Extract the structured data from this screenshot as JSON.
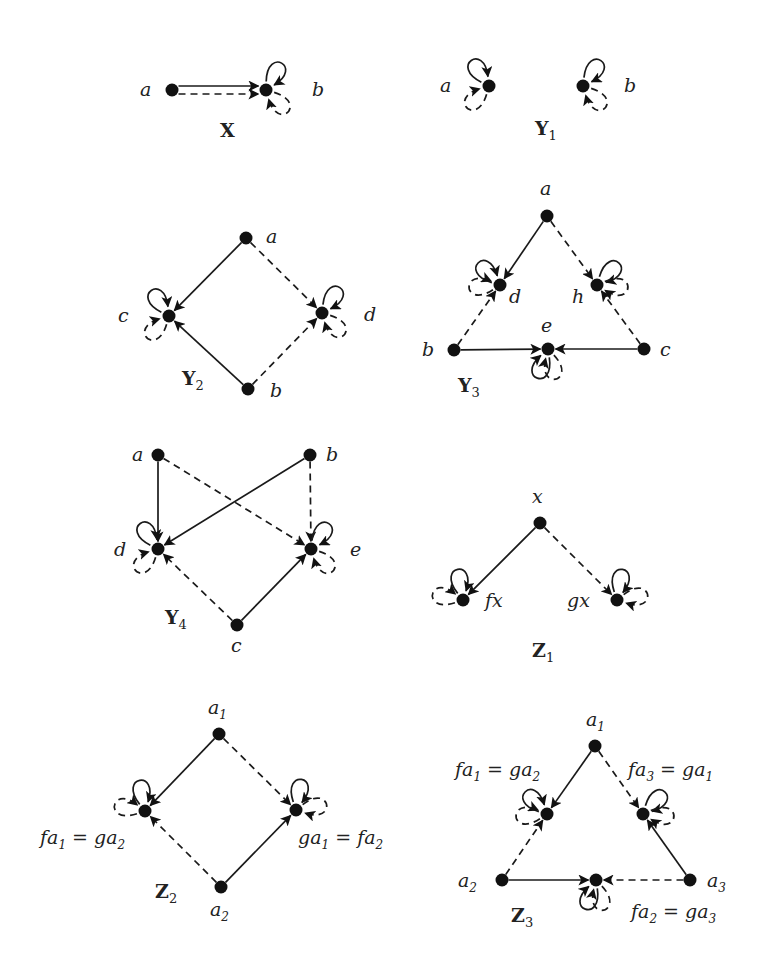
{
  "figure": {
    "colors": {
      "ink": "#1a1a1a",
      "background": "#ffffff"
    },
    "graphs": [
      {
        "id": "X",
        "title": "X",
        "subscript": "",
        "title_pos": [
          220,
          137
        ],
        "nodes": [
          {
            "id": "a",
            "x": 172,
            "y": 90,
            "label": "a",
            "lx": 140,
            "ly": 96
          },
          {
            "id": "b",
            "x": 266,
            "y": 90,
            "label": "b",
            "lx": 312,
            "ly": 96
          }
        ],
        "edges": [
          {
            "from": "a",
            "to": "b",
            "style": "solid",
            "offset": -4
          },
          {
            "from": "a",
            "to": "b",
            "style": "dashed",
            "offset": 4
          }
        ],
        "loops": [
          {
            "node": "b",
            "style": "solid",
            "angle": -60
          },
          {
            "node": "b",
            "style": "dashed",
            "angle": 45
          }
        ]
      },
      {
        "id": "Y1",
        "title": "Y",
        "subscript": "1",
        "title_pos": [
          535,
          135
        ],
        "nodes": [
          {
            "id": "a",
            "x": 489,
            "y": 86,
            "label": "a",
            "lx": 440,
            "ly": 92
          },
          {
            "id": "b",
            "x": 583,
            "y": 86,
            "label": "b",
            "lx": 624,
            "ly": 92
          }
        ],
        "edges": [],
        "loops": [
          {
            "node": "a",
            "style": "solid",
            "angle": -125
          },
          {
            "node": "a",
            "style": "dashed",
            "angle": 135
          },
          {
            "node": "b",
            "style": "solid",
            "angle": -55
          },
          {
            "node": "b",
            "style": "dashed",
            "angle": 45
          }
        ]
      },
      {
        "id": "Y2",
        "title": "Y",
        "subscript": "2",
        "title_pos": [
          182,
          385
        ],
        "nodes": [
          {
            "id": "a",
            "x": 246,
            "y": 238,
            "label": "a",
            "lx": 266,
            "ly": 243
          },
          {
            "id": "c",
            "x": 169,
            "y": 316,
            "label": "c",
            "lx": 118,
            "ly": 322
          },
          {
            "id": "d",
            "x": 322,
            "y": 313,
            "label": "d",
            "lx": 364,
            "ly": 321
          },
          {
            "id": "b",
            "x": 248,
            "y": 389,
            "label": "b",
            "lx": 270,
            "ly": 397
          }
        ],
        "edges": [
          {
            "from": "a",
            "to": "c",
            "style": "solid"
          },
          {
            "from": "a",
            "to": "d",
            "style": "dashed"
          },
          {
            "from": "b",
            "to": "c",
            "style": "solid"
          },
          {
            "from": "b",
            "to": "d",
            "style": "dashed"
          }
        ],
        "loops": [
          {
            "node": "c",
            "style": "solid",
            "angle": -125
          },
          {
            "node": "c",
            "style": "dashed",
            "angle": 135
          },
          {
            "node": "d",
            "style": "solid",
            "angle": -55
          },
          {
            "node": "d",
            "style": "dashed",
            "angle": 45
          }
        ]
      },
      {
        "id": "Y3",
        "title": "Y",
        "subscript": "3",
        "title_pos": [
          458,
          392
        ],
        "nodes": [
          {
            "id": "a",
            "x": 547,
            "y": 216,
            "label": "a",
            "lx": 540,
            "ly": 195
          },
          {
            "id": "d",
            "x": 500,
            "y": 285,
            "label": "d",
            "lx": 509,
            "ly": 303
          },
          {
            "id": "h",
            "x": 597,
            "y": 285,
            "label": "h",
            "lx": 572,
            "ly": 303
          },
          {
            "id": "b",
            "x": 454,
            "y": 350,
            "label": "b",
            "lx": 422,
            "ly": 356
          },
          {
            "id": "e",
            "x": 548,
            "y": 349,
            "label": "e",
            "lx": 541,
            "ly": 332
          },
          {
            "id": "c",
            "x": 644,
            "y": 349,
            "label": "c",
            "lx": 660,
            "ly": 356
          }
        ],
        "edges": [
          {
            "from": "a",
            "to": "d",
            "style": "solid"
          },
          {
            "from": "a",
            "to": "h",
            "style": "dashed"
          },
          {
            "from": "b",
            "to": "d",
            "style": "dashed"
          },
          {
            "from": "c",
            "to": "h",
            "style": "dashed"
          },
          {
            "from": "b",
            "to": "e",
            "style": "solid"
          },
          {
            "from": "c",
            "to": "e",
            "style": "solid"
          }
        ],
        "loops": [
          {
            "node": "d",
            "style": "solid",
            "angle": -135
          },
          {
            "node": "d",
            "style": "dashed",
            "angle": 175
          },
          {
            "node": "h",
            "style": "solid",
            "angle": -45
          },
          {
            "node": "h",
            "style": "dashed",
            "angle": 5
          },
          {
            "node": "e",
            "style": "solid",
            "angle": 110
          },
          {
            "node": "e",
            "style": "dashed",
            "angle": 75
          }
        ]
      },
      {
        "id": "Y4",
        "title": "Y",
        "subscript": "4",
        "title_pos": [
          165,
          624
        ],
        "nodes": [
          {
            "id": "a",
            "x": 158,
            "y": 455,
            "label": "a",
            "lx": 132,
            "ly": 461
          },
          {
            "id": "b",
            "x": 310,
            "y": 455,
            "label": "b",
            "lx": 326,
            "ly": 461
          },
          {
            "id": "d",
            "x": 158,
            "y": 549,
            "label": "d",
            "lx": 114,
            "ly": 556
          },
          {
            "id": "e",
            "x": 311,
            "y": 549,
            "label": "e",
            "lx": 350,
            "ly": 556
          },
          {
            "id": "c",
            "x": 237,
            "y": 625,
            "label": "c",
            "lx": 231,
            "ly": 652
          }
        ],
        "edges": [
          {
            "from": "a",
            "to": "d",
            "style": "solid"
          },
          {
            "from": "a",
            "to": "e",
            "style": "dashed"
          },
          {
            "from": "b",
            "to": "d",
            "style": "solid"
          },
          {
            "from": "b",
            "to": "e",
            "style": "dashed"
          },
          {
            "from": "c",
            "to": "d",
            "style": "dashed"
          },
          {
            "from": "c",
            "to": "e",
            "style": "solid"
          }
        ],
        "loops": [
          {
            "node": "d",
            "style": "solid",
            "angle": -125
          },
          {
            "node": "d",
            "style": "dashed",
            "angle": 135
          },
          {
            "node": "e",
            "style": "solid",
            "angle": -55
          },
          {
            "node": "e",
            "style": "dashed",
            "angle": 45
          }
        ]
      },
      {
        "id": "Z1",
        "title": "Z",
        "subscript": "1",
        "title_pos": [
          532,
          657
        ],
        "nodes": [
          {
            "id": "x",
            "x": 540,
            "y": 523,
            "label": "x",
            "lx": 532,
            "ly": 503
          },
          {
            "id": "fx",
            "x": 463,
            "y": 600,
            "label": "fx",
            "lx": 485,
            "ly": 607
          },
          {
            "id": "gx",
            "x": 617,
            "y": 600,
            "label": "gx",
            "lx": 567,
            "ly": 607
          }
        ],
        "edges": [
          {
            "from": "x",
            "to": "fx",
            "style": "solid"
          },
          {
            "from": "x",
            "to": "gx",
            "style": "dashed"
          }
        ],
        "loops": [
          {
            "node": "fx",
            "style": "solid",
            "angle": -100
          },
          {
            "node": "fx",
            "style": "dashed",
            "angle": -170
          },
          {
            "node": "gx",
            "style": "solid",
            "angle": -80
          },
          {
            "node": "gx",
            "style": "dashed",
            "angle": -10
          }
        ]
      },
      {
        "id": "Z2",
        "title": "Z",
        "subscript": "2",
        "title_pos": [
          155,
          898
        ],
        "nodes": [
          {
            "id": "a1",
            "x": 219,
            "y": 734,
            "label": "a",
            "sub": "1",
            "lx": 208,
            "ly": 714
          },
          {
            "id": "L",
            "x": 145,
            "y": 811,
            "label": "fa",
            "sub": "1",
            "rest": " = ga",
            "sub2": "2",
            "lx": 40,
            "ly": 844
          },
          {
            "id": "R",
            "x": 296,
            "y": 810,
            "label": "ga",
            "sub": "1",
            "rest": " = fa",
            "sub2": "2",
            "lx": 298,
            "ly": 844
          },
          {
            "id": "a2",
            "x": 221,
            "y": 887,
            "label": "a",
            "sub": "2",
            "lx": 210,
            "ly": 916
          }
        ],
        "edges": [
          {
            "from": "a1",
            "to": "L",
            "style": "solid"
          },
          {
            "from": "a1",
            "to": "R",
            "style": "dashed"
          },
          {
            "from": "a2",
            "to": "L",
            "style": "dashed"
          },
          {
            "from": "a2",
            "to": "R",
            "style": "solid"
          }
        ],
        "loops": [
          {
            "node": "L",
            "style": "solid",
            "angle": -100
          },
          {
            "node": "L",
            "style": "dashed",
            "angle": -170
          },
          {
            "node": "R",
            "style": "solid",
            "angle": -80
          },
          {
            "node": "R",
            "style": "dashed",
            "angle": -10
          }
        ]
      },
      {
        "id": "Z3",
        "title": "Z",
        "subscript": "3",
        "title_pos": [
          511,
          922
        ],
        "nodes": [
          {
            "id": "a1",
            "x": 595,
            "y": 746,
            "label": "a",
            "sub": "1",
            "lx": 586,
            "ly": 726
          },
          {
            "id": "L",
            "x": 547,
            "y": 814,
            "label": "fa",
            "sub": "1",
            "rest": " = ga",
            "sub2": "2",
            "lx": 455,
            "ly": 776
          },
          {
            "id": "R",
            "x": 643,
            "y": 814,
            "label": "fa",
            "sub": "3",
            "rest": " = ga",
            "sub2": "1",
            "lx": 628,
            "ly": 776
          },
          {
            "id": "a2",
            "x": 502,
            "y": 880,
            "label": "a",
            "sub": "2",
            "lx": 458,
            "ly": 887
          },
          {
            "id": "e",
            "x": 596,
            "y": 880,
            "label": "fa",
            "sub": "2",
            "rest": " = ga",
            "sub2": "3",
            "lx": 631,
            "ly": 918
          },
          {
            "id": "a3",
            "x": 690,
            "y": 880,
            "label": "a",
            "sub": "3",
            "lx": 707,
            "ly": 887
          }
        ],
        "edges": [
          {
            "from": "a1",
            "to": "L",
            "style": "solid"
          },
          {
            "from": "a1",
            "to": "R",
            "style": "dashed"
          },
          {
            "from": "a2",
            "to": "L",
            "style": "dashed"
          },
          {
            "from": "a3",
            "to": "R",
            "style": "solid"
          },
          {
            "from": "a2",
            "to": "e",
            "style": "solid"
          },
          {
            "from": "a3",
            "to": "e",
            "style": "dashed"
          }
        ],
        "loops": [
          {
            "node": "L",
            "style": "solid",
            "angle": -135
          },
          {
            "node": "L",
            "style": "dashed",
            "angle": 175
          },
          {
            "node": "R",
            "style": "solid",
            "angle": -45
          },
          {
            "node": "R",
            "style": "dashed",
            "angle": 5
          },
          {
            "node": "e",
            "style": "solid",
            "angle": 110
          },
          {
            "node": "e",
            "style": "dashed",
            "angle": 75
          }
        ]
      }
    ]
  }
}
